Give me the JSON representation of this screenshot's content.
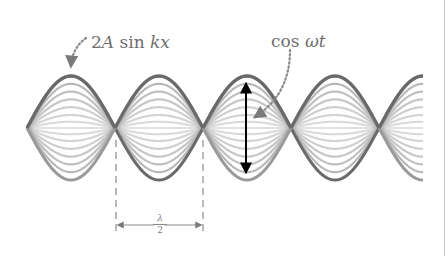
{
  "figure": {
    "labels": {
      "amplitude_prefix": "2",
      "amplitude_var": "A",
      "amplitude_fn": " sin ",
      "amplitude_arg": "kx",
      "time_fn": "cos ",
      "time_arg": "ωt",
      "half_wavelength_num": "λ",
      "half_wavelength_den": "2"
    },
    "colors": {
      "bold_envelope": "#6a6a6a",
      "inner_curves": "#a8a8a8",
      "annotation_arrow": "#000000",
      "dotted_pointer": "#8a8a8a",
      "dimension_lines": "#8a8a8a",
      "text": "#6e6e6e"
    },
    "geometry": {
      "center_y": 128,
      "amplitude_px": 52,
      "start_x": 27,
      "half_wavelength_px": 88,
      "end_x": 423,
      "nodes_x": [
        115,
        203,
        291,
        379
      ],
      "curve_fractions": [
        1.0,
        0.85,
        0.7,
        0.55,
        0.4,
        0.25,
        0.12,
        0.0,
        -0.12,
        -0.25,
        -0.4,
        -0.55,
        -0.7,
        -0.85,
        -1.0
      ],
      "oscillation_arrow": {
        "x": 246,
        "y_top": 84,
        "y_bottom": 172
      },
      "dashed_lines_x": [
        116,
        203
      ],
      "dashed_y": [
        140,
        232
      ],
      "dimension_arrow_y": 225
    }
  }
}
